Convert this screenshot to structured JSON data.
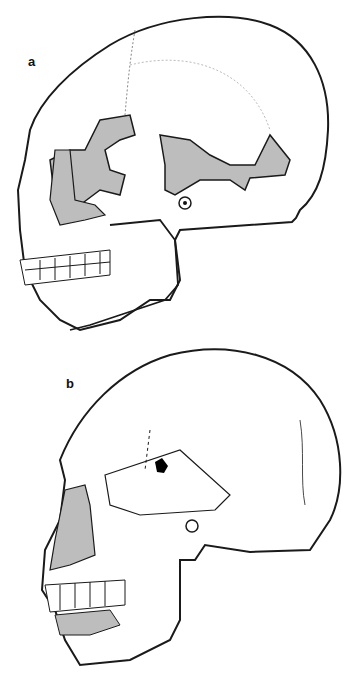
{
  "figure": {
    "panels": [
      {
        "label": "a",
        "description": "Lateral view of skull with shaded reconstructed regions"
      },
      {
        "label": "b",
        "description": "Lateral view of skull with shaded maxillary region and dark parietal mark"
      }
    ],
    "colors": {
      "outline": "#1a1a1a",
      "shade": "#bdbdbd",
      "hatch": "#7a7a7a",
      "background": "#ffffff",
      "mark": "#000000"
    }
  }
}
